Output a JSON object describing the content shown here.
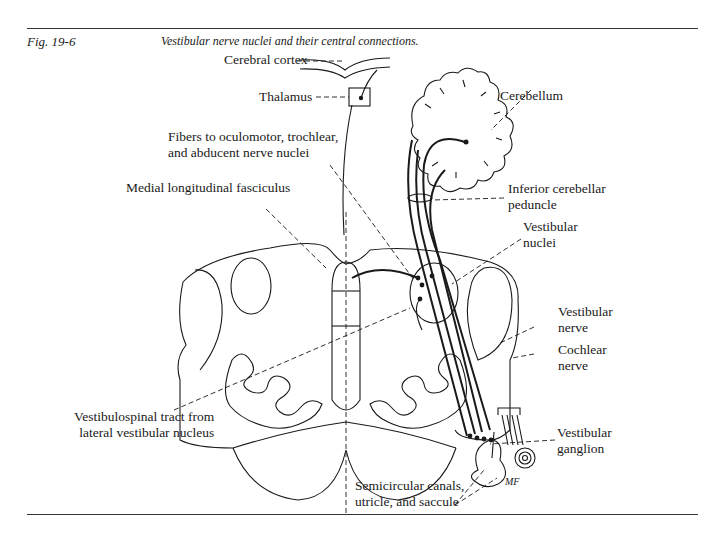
{
  "figure": {
    "number": "Fig. 19-6",
    "caption": "Vestibular nerve nuclei and their central connections."
  },
  "labels": {
    "cerebral_cortex": "Cerebral cortex",
    "thalamus": "Thalamus",
    "cerebellum": "Cerebellum",
    "fibers_line1": "Fibers to oculomotor, trochlear,",
    "fibers_line2": "and   abducent nerve nuclei",
    "mlf": "Medial longitudinal fasciculus",
    "icp_line1": "Inferior cerebellar",
    "icp_line2": "peduncle",
    "vn_line1": "Vestibular",
    "vn_line2": "nuclei",
    "vnerve_line1": "Vestibular",
    "vnerve_line2": "nerve",
    "cochlear_line1": "Cochlear",
    "cochlear_line2": "nerve",
    "vst_line1": "Vestibulospinal tract from",
    "vst_line2": "lateral  vestibular nucleus",
    "vg_line1": "Vestibular",
    "vg_line2": "ganglion",
    "scc_line1": "Semicircular canals,",
    "scc_line2": "utricle, and  saccule",
    "artist_initials": "MF"
  },
  "colors": {
    "ink": "#1a1a1a",
    "background": "#ffffff"
  }
}
